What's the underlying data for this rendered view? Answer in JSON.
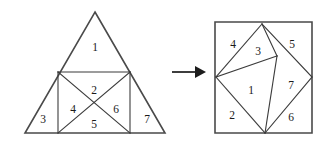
{
  "figure": {
    "kind": "geometric-dissection-diagram",
    "background_color": "#ffffff",
    "line_color": "#3b3b3b",
    "outline_color": "#4a4a4a",
    "label_color": "#1a1a1a",
    "arrow_color": "#1c1c1c",
    "piece_count": 7
  },
  "left_figure": {
    "name": "triangle",
    "shape": "equilateral-triangle",
    "outline_points": "95,12 165,133 25,133",
    "inner_square_points": "58,72 130,72 130,133 58,133",
    "edges": [
      {
        "name": "inner-square-top",
        "d": "M58,72 L130,72"
      },
      {
        "name": "inner-square-left",
        "d": "M58,72 L58,133"
      },
      {
        "name": "inner-square-right",
        "d": "M130,72 L130,133"
      },
      {
        "name": "diagonal-tl-br",
        "d": "M58,72 L130,133"
      },
      {
        "name": "diagonal-tr-bl",
        "d": "M130,72 L58,133"
      }
    ],
    "labels": [
      {
        "id": "1",
        "text": "1",
        "x": 95,
        "y": 48
      },
      {
        "id": "2",
        "text": "2",
        "x": 94,
        "y": 91
      },
      {
        "id": "3",
        "text": "3",
        "x": 43,
        "y": 120
      },
      {
        "id": "4",
        "text": "4",
        "x": 73,
        "y": 110
      },
      {
        "id": "5",
        "text": "5",
        "x": 94,
        "y": 125
      },
      {
        "id": "6",
        "text": "6",
        "x": 116,
        "y": 110
      },
      {
        "id": "7",
        "text": "7",
        "x": 147,
        "y": 120
      }
    ]
  },
  "right_figure": {
    "name": "square",
    "shape": "square",
    "outline_points": "215,22 312,22 312,133 215,133",
    "edges": [
      {
        "name": "quad-top-left-edge",
        "d": "M262,24 L216,77"
      },
      {
        "name": "quad-left-bottom-edge",
        "d": "M216,77 L265,133"
      },
      {
        "name": "quad-bottom-right-edge",
        "d": "M265,133 L312,77"
      },
      {
        "name": "quad-right-top-edge",
        "d": "M312,77 L262,24"
      },
      {
        "name": "cut-apex-to-node",
        "d": "M262,24 L277,56"
      },
      {
        "name": "cut-left-to-node",
        "d": "M216,77 L277,56"
      },
      {
        "name": "cut-node-to-bottom",
        "d": "M277,56 L265,133"
      }
    ],
    "labels": [
      {
        "id": "4",
        "text": "4",
        "x": 233,
        "y": 45
      },
      {
        "id": "3",
        "text": "3",
        "x": 258,
        "y": 52
      },
      {
        "id": "5",
        "text": "5",
        "x": 292,
        "y": 45
      },
      {
        "id": "1",
        "text": "1",
        "x": 251,
        "y": 91
      },
      {
        "id": "7",
        "text": "7",
        "x": 291,
        "y": 86
      },
      {
        "id": "2",
        "text": "2",
        "x": 232,
        "y": 116
      },
      {
        "id": "6",
        "text": "6",
        "x": 291,
        "y": 118
      }
    ]
  },
  "arrow": {
    "name": "transformation-arrow",
    "direction": "right",
    "line_d": "M172,72 L196,72",
    "head_points": "195,66 206,72 195,78"
  }
}
